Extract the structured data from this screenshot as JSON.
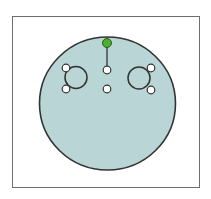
{
  "figure": {
    "colors": {
      "shape_fill": "#b9d5d5",
      "shape_stroke": "#333333",
      "rotate_handle": "#4caf2f",
      "handle_fill": "#ffffff",
      "handle_stroke": "#333333",
      "frame_stroke": "#6e6e6e"
    },
    "shape": {
      "type": "circle",
      "cx": 107.5,
      "cy": 103.5,
      "rx": 68,
      "ry": 66.5
    },
    "rotate_handle": {
      "name": "rotate-handle",
      "cx": 107,
      "cy": 43,
      "r": 4.5
    },
    "rotate_line": {
      "x1": 107,
      "y1": 47,
      "x2": 107,
      "y2": 66
    },
    "left_eye": {
      "cx": 76,
      "cy": 77.5,
      "r": 11
    },
    "right_eye": {
      "cx": 139,
      "cy": 78,
      "r": 11
    },
    "handles": [
      {
        "name": "center-top-handle",
        "cx": 107,
        "cy": 70
      },
      {
        "name": "center-bottom-handle",
        "cx": 107,
        "cy": 89
      },
      {
        "name": "left-eye-top-handle",
        "cx": 66,
        "cy": 68
      },
      {
        "name": "left-eye-bottom-handle",
        "cx": 66,
        "cy": 89
      },
      {
        "name": "right-eye-top-handle",
        "cx": 151,
        "cy": 68
      },
      {
        "name": "right-eye-bottom-handle",
        "cx": 151,
        "cy": 90
      }
    ],
    "handle_radius": 3.8
  }
}
